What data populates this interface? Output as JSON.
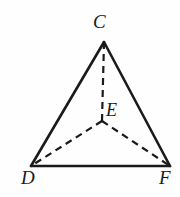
{
  "figure": {
    "kind": "tetrahedron-diagram",
    "background_color": "#fefefe",
    "stroke_color": "#1a1a1a",
    "label_color": "#1a1a1a",
    "solid_stroke_width": 2.6,
    "dashed_stroke_width": 2.2,
    "dash_pattern": "7 5",
    "labels": {
      "C": "C",
      "E": "E",
      "D": "D",
      "F": "F"
    },
    "points": {
      "C": {
        "x": 104,
        "y": 42
      },
      "E": {
        "x": 102,
        "y": 121
      },
      "D": {
        "x": 31,
        "y": 166
      },
      "F": {
        "x": 170,
        "y": 166
      }
    },
    "solid_edges": [
      {
        "name": "edge-CD",
        "from": "C",
        "to": "D"
      },
      {
        "name": "edge-CF",
        "from": "C",
        "to": "F"
      },
      {
        "name": "edge-DF",
        "from": "D",
        "to": "F"
      }
    ],
    "dashed_edges": [
      {
        "name": "edge-CE",
        "from": "C",
        "to": "E"
      },
      {
        "name": "edge-ED",
        "from": "E",
        "to": "D"
      },
      {
        "name": "edge-EF",
        "from": "E",
        "to": "F"
      }
    ]
  }
}
